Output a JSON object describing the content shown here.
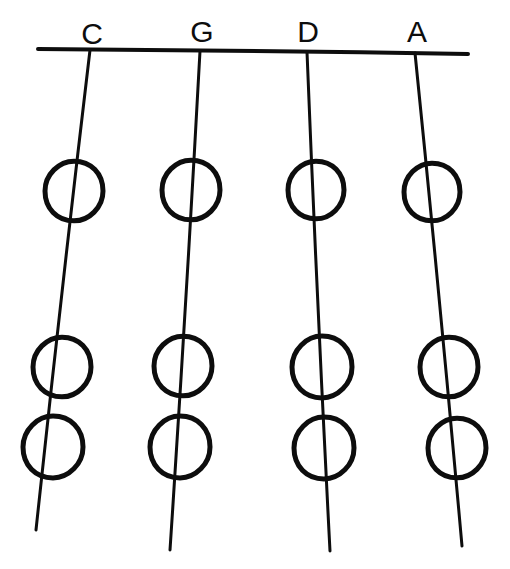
{
  "diagram": {
    "type": "string-instrument-fingering-chart",
    "background_color": "#ffffff",
    "ink_color": "#0d0d0d",
    "canvas": {
      "width": 510,
      "height": 569
    },
    "nut": {
      "name": "nut-line",
      "x1": 38,
      "y1": 49,
      "x2": 468,
      "y2": 54,
      "stroke_width": 4
    },
    "strings": [
      {
        "label": "C",
        "label_x": 92,
        "label_y": 44,
        "top_x": 90,
        "top_y": 50,
        "bottom_x": 36,
        "bottom_y": 530,
        "stroke_width": 3,
        "circles": [
          {
            "cx": 74,
            "cy": 191,
            "r": 29,
            "filled": false,
            "stroke_width": 5
          },
          {
            "cx": 62,
            "cy": 367,
            "r": 29,
            "filled": false,
            "stroke_width": 5
          },
          {
            "cx": 53,
            "cy": 447,
            "r": 30,
            "filled": false,
            "stroke_width": 5
          }
        ]
      },
      {
        "label": "G",
        "label_x": 202,
        "label_y": 42,
        "top_x": 200,
        "top_y": 51,
        "bottom_x": 170,
        "bottom_y": 550,
        "stroke_width": 3,
        "circles": [
          {
            "cx": 191,
            "cy": 190,
            "r": 29,
            "filled": false,
            "stroke_width": 5
          },
          {
            "cx": 183,
            "cy": 366,
            "r": 29,
            "filled": false,
            "stroke_width": 5
          },
          {
            "cx": 180,
            "cy": 447,
            "r": 30,
            "filled": false,
            "stroke_width": 5
          }
        ]
      },
      {
        "label": "D",
        "label_x": 308,
        "label_y": 42,
        "top_x": 307,
        "top_y": 52,
        "bottom_x": 330,
        "bottom_y": 551,
        "stroke_width": 3,
        "circles": [
          {
            "cx": 316,
            "cy": 190,
            "r": 28,
            "filled": false,
            "stroke_width": 5
          },
          {
            "cx": 322,
            "cy": 367,
            "r": 30,
            "filled": false,
            "stroke_width": 5
          },
          {
            "cx": 324,
            "cy": 448,
            "r": 30,
            "filled": false,
            "stroke_width": 5
          }
        ]
      },
      {
        "label": "A",
        "label_x": 417,
        "label_y": 42,
        "top_x": 415,
        "top_y": 53,
        "bottom_x": 462,
        "bottom_y": 546,
        "stroke_width": 3,
        "circles": [
          {
            "cx": 432,
            "cy": 192,
            "r": 28,
            "filled": false,
            "stroke_width": 5
          },
          {
            "cx": 449,
            "cy": 367,
            "r": 29,
            "filled": false,
            "stroke_width": 5
          },
          {
            "cx": 457,
            "cy": 448,
            "r": 29,
            "filled": false,
            "stroke_width": 5
          }
        ]
      }
    ]
  }
}
